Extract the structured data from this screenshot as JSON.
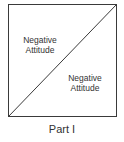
{
  "diagram": {
    "upper_region_label_line1": "Negative",
    "upper_region_label_line2": "Attitude",
    "lower_region_label_line1": "Negative",
    "lower_region_label_line2": "Attitude",
    "caption": "Part I",
    "line_color": "#3a3a3a"
  }
}
